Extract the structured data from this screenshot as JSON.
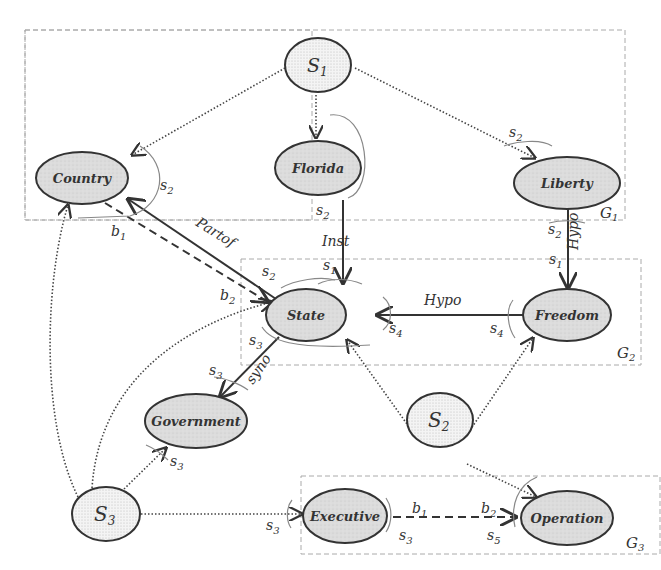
{
  "diagram": {
    "groups": [
      {
        "id": "G1",
        "label": "G",
        "sub": "1"
      },
      {
        "id": "G2",
        "label": "G",
        "sub": "2"
      },
      {
        "id": "G3",
        "label": "G",
        "sub": "3"
      }
    ],
    "nodes": {
      "s1": {
        "label": "S",
        "sub": "1",
        "kind": "seed"
      },
      "s2": {
        "label": "S",
        "sub": "2",
        "kind": "seed"
      },
      "s3": {
        "label": "S",
        "sub": "3",
        "kind": "seed"
      },
      "country": {
        "label": "Country",
        "kind": "concept"
      },
      "florida": {
        "label": "Florida",
        "kind": "concept"
      },
      "liberty": {
        "label": "Liberty",
        "kind": "concept"
      },
      "state": {
        "label": "State",
        "kind": "concept"
      },
      "freedom": {
        "label": "Freedom",
        "kind": "concept"
      },
      "government": {
        "label": "Government",
        "kind": "concept"
      },
      "executive": {
        "label": "Executive",
        "kind": "concept"
      },
      "operation": {
        "label": "Operation",
        "kind": "concept"
      }
    },
    "edge_labels": {
      "partof": "Partof",
      "inst": "Inst",
      "hypo_vertical": "Hypo",
      "hypo_horizontal": "Hypo",
      "syno": "syno"
    },
    "annotations": {
      "s": "s",
      "b": "b",
      "n1": "1",
      "n2": "2",
      "n3": "3",
      "n4": "4",
      "n5": "5"
    },
    "edges": [
      {
        "from": "S1",
        "to": "Country",
        "style": "dotted"
      },
      {
        "from": "S1",
        "to": "Florida",
        "style": "dotted"
      },
      {
        "from": "S1",
        "to": "Liberty",
        "style": "dotted"
      },
      {
        "from": "State",
        "to": "Country",
        "style": "solid",
        "label": "Partof"
      },
      {
        "from": "Florida",
        "to": "State",
        "style": "solid",
        "label": "Inst"
      },
      {
        "from": "Liberty",
        "to": "Freedom",
        "style": "solid",
        "label": "Hypo"
      },
      {
        "from": "Freedom",
        "to": "State",
        "style": "solid",
        "label": "Hypo"
      },
      {
        "from": "State",
        "to": "Government",
        "style": "solid",
        "label": "syno"
      },
      {
        "from": "Country",
        "to": "State",
        "style": "dashed",
        "label": "b1-b2"
      },
      {
        "from": "S2",
        "to": "State",
        "style": "dotted"
      },
      {
        "from": "S2",
        "to": "Freedom",
        "style": "dotted"
      },
      {
        "from": "S2",
        "to": "Operation",
        "style": "dotted"
      },
      {
        "from": "S3",
        "to": "Country",
        "style": "dotted"
      },
      {
        "from": "S3",
        "to": "State",
        "style": "dotted"
      },
      {
        "from": "S3",
        "to": "Government",
        "style": "dotted"
      },
      {
        "from": "S3",
        "to": "Executive",
        "style": "dotted"
      },
      {
        "from": "Executive",
        "to": "Operation",
        "style": "dashed",
        "label": "b1-b2"
      }
    ]
  }
}
